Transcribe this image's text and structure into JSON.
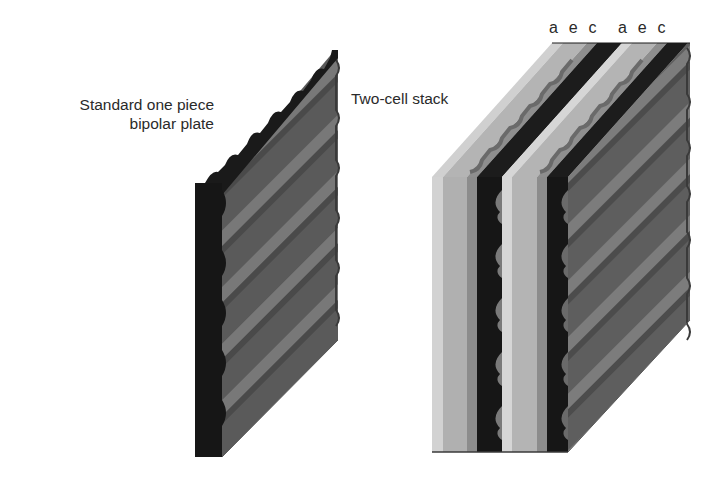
{
  "figure": {
    "plate_label_line1": "Standard one piece",
    "plate_label_line2": "bipolar plate",
    "stack_label": "Two-cell stack",
    "layer_labels": [
      "a e c",
      "a e c"
    ],
    "layer_legend": {
      "a": "anode",
      "e": "electrolyte",
      "c": "cathode"
    }
  },
  "colors": {
    "background": "#ffffff",
    "plate_dark": "#1a1a1a",
    "plate_face": "#5e5e5e",
    "ridge": "#7a7a7a",
    "anode_light": "#c8c8c8",
    "electrolyte_mid": "#a8a8a8",
    "cathode_gray": "#8c8c8c",
    "text": "#2a2a2a"
  }
}
